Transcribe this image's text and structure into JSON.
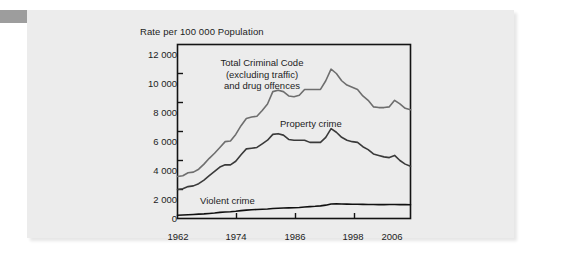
{
  "figure": {
    "background_color": "#ececec",
    "page_background": "#ffffff",
    "marker_color": "#9d9d9d"
  },
  "chart_data": {
    "type": "line",
    "title": "",
    "subtitle": "",
    "xlabel": "",
    "ylabel": "Rate per 100 000 Population",
    "xlim": [
      1962,
      2006
    ],
    "ylim": [
      0,
      12000
    ],
    "grid": false,
    "legend_position": "inline-annotations",
    "ytick_labels": [
      "0",
      "2 000",
      "4 000",
      "6 000",
      "8 000",
      "10 000",
      "12 000"
    ],
    "ytick_values": [
      0,
      2000,
      4000,
      6000,
      8000,
      10000,
      12000
    ],
    "xtick_labels": [
      "1962",
      "1974",
      "1986",
      "1998",
      "2006"
    ],
    "xtick_values": [
      1962,
      1974,
      1986,
      1998,
      2006
    ],
    "annotations": [
      {
        "name": "total-criminal-code-label",
        "lines": [
          "Total Criminal Code",
          "(excluding traffic)",
          "and drug offences"
        ],
        "text": "Total Criminal Code (excluding traffic) and drug offences"
      },
      {
        "name": "property-crime-label",
        "lines": [
          "Property crime"
        ],
        "text": "Property crime"
      },
      {
        "name": "violent-crime-label",
        "lines": [
          "Violent crime"
        ],
        "text": "Violent crime"
      }
    ],
    "x": [
      1962,
      1963,
      1964,
      1965,
      1966,
      1967,
      1968,
      1969,
      1970,
      1971,
      1972,
      1973,
      1974,
      1975,
      1976,
      1977,
      1978,
      1979,
      1980,
      1981,
      1982,
      1983,
      1984,
      1985,
      1986,
      1987,
      1988,
      1989,
      1990,
      1991,
      1992,
      1993,
      1994,
      1995,
      1996,
      1997,
      1998,
      1999,
      2000,
      2001,
      2002,
      2003,
      2004,
      2005,
      2006
    ],
    "series": [
      {
        "name": "Total Criminal Code (excluding traffic) and drug offences",
        "color": "#6e6e6e",
        "values": [
          2900,
          2950,
          3150,
          3200,
          3400,
          3750,
          4150,
          4500,
          4900,
          5300,
          5350,
          5800,
          6400,
          6900,
          7000,
          7050,
          7450,
          7900,
          8750,
          8850,
          8750,
          8450,
          8400,
          8500,
          8900,
          8900,
          8900,
          8900,
          9500,
          10300,
          10000,
          9500,
          9200,
          9050,
          8900,
          8450,
          8150,
          7700,
          7650,
          7650,
          7700,
          8150,
          7900,
          7600,
          7500
        ]
      },
      {
        "name": "Property crime",
        "color": "#3a3a3a",
        "values": [
          2000,
          2050,
          2200,
          2250,
          2400,
          2650,
          2950,
          3250,
          3550,
          3700,
          3700,
          3950,
          4400,
          4800,
          4850,
          4900,
          5150,
          5400,
          5800,
          5850,
          5750,
          5450,
          5400,
          5400,
          5400,
          5250,
          5250,
          5250,
          5600,
          6200,
          5950,
          5600,
          5400,
          5300,
          5250,
          4950,
          4750,
          4450,
          4350,
          4250,
          4200,
          4350,
          4000,
          3750,
          3600
        ]
      },
      {
        "name": "Violent crime",
        "color": "#111111",
        "values": [
          220,
          240,
          260,
          280,
          300,
          320,
          350,
          380,
          420,
          450,
          470,
          500,
          540,
          580,
          600,
          620,
          640,
          660,
          690,
          710,
          720,
          730,
          740,
          760,
          790,
          820,
          840,
          870,
          920,
          1000,
          1010,
          1000,
          990,
          985,
          980,
          975,
          970,
          965,
          960,
          960,
          965,
          965,
          960,
          955,
          950
        ]
      }
    ]
  }
}
